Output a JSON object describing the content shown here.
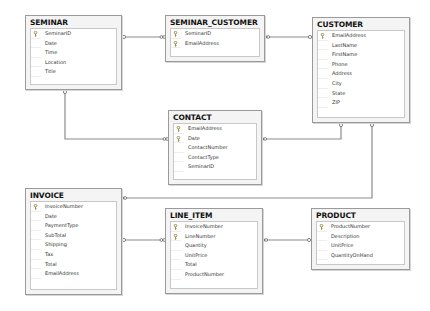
{
  "diagram": {
    "type": "database-schema",
    "tables": [
      {
        "id": "seminar",
        "name": "SEMINAR",
        "box": {
          "x": 25,
          "y": 15,
          "w": 97,
          "h": 75
        },
        "columns": [
          {
            "name": "SeminarID",
            "pk": true
          },
          {
            "name": "Date",
            "pk": false
          },
          {
            "name": "Time",
            "pk": false
          },
          {
            "name": "Location",
            "pk": false
          },
          {
            "name": "Title",
            "pk": false
          }
        ]
      },
      {
        "id": "seminar_customer",
        "name": "SEMINAR_CUSTOMER",
        "box": {
          "x": 165,
          "y": 15,
          "w": 100,
          "h": 47
        },
        "columns": [
          {
            "name": "SeminarID",
            "pk": true
          },
          {
            "name": "EmailAddress",
            "pk": true
          }
        ]
      },
      {
        "id": "customer",
        "name": "CUSTOMER",
        "box": {
          "x": 312,
          "y": 17,
          "w": 98,
          "h": 106
        },
        "columns": [
          {
            "name": "EmailAddress",
            "pk": true
          },
          {
            "name": "LastName",
            "pk": false
          },
          {
            "name": "FirstName",
            "pk": false
          },
          {
            "name": "Phone",
            "pk": false
          },
          {
            "name": "Address",
            "pk": false
          },
          {
            "name": "City",
            "pk": false
          },
          {
            "name": "State",
            "pk": false
          },
          {
            "name": "ZIP",
            "pk": false
          }
        ]
      },
      {
        "id": "contact",
        "name": "CONTACT",
        "box": {
          "x": 168,
          "y": 110,
          "w": 94,
          "h": 75
        },
        "columns": [
          {
            "name": "EmailAddress",
            "pk": true
          },
          {
            "name": "Date",
            "pk": true
          },
          {
            "name": "ContactNumber",
            "pk": false
          },
          {
            "name": "ContactType",
            "pk": false
          },
          {
            "name": "SeminarID",
            "pk": false
          }
        ]
      },
      {
        "id": "invoice",
        "name": "INVOICE",
        "box": {
          "x": 25,
          "y": 188,
          "w": 97,
          "h": 107
        },
        "columns": [
          {
            "name": "InvoiceNumber",
            "pk": true
          },
          {
            "name": "Date",
            "pk": false
          },
          {
            "name": "PaymentType",
            "pk": false
          },
          {
            "name": "SubTotal",
            "pk": false
          },
          {
            "name": "Shipping",
            "pk": false
          },
          {
            "name": "Tax",
            "pk": false
          },
          {
            "name": "Total",
            "pk": false
          },
          {
            "name": "EmailAddress",
            "pk": false
          }
        ]
      },
      {
        "id": "line_item",
        "name": "LINE_ITEM",
        "box": {
          "x": 165,
          "y": 208,
          "w": 98,
          "h": 86
        },
        "columns": [
          {
            "name": "InvoiceNumber",
            "pk": true
          },
          {
            "name": "LineNumber",
            "pk": true
          },
          {
            "name": "Quantity",
            "pk": false
          },
          {
            "name": "UnitPrice",
            "pk": false
          },
          {
            "name": "Total",
            "pk": false
          },
          {
            "name": "ProductNumber",
            "pk": false
          }
        ]
      },
      {
        "id": "product",
        "name": "PRODUCT",
        "box": {
          "x": 311,
          "y": 208,
          "w": 99,
          "h": 62
        },
        "columns": [
          {
            "name": "ProductNumber",
            "pk": true
          },
          {
            "name": "Description",
            "pk": false
          },
          {
            "name": "UnitPrice",
            "pk": false
          },
          {
            "name": "QuantityOnHand",
            "pk": false
          }
        ]
      }
    ],
    "relationships": [
      {
        "from": "seminar",
        "to": "seminar_customer",
        "path": "M122,37 L165,37",
        "one_end": [
          124,
          37
        ],
        "many_end": [
          163,
          37
        ]
      },
      {
        "from": "customer",
        "to": "seminar_customer",
        "path": "M265,37 L312,37",
        "one_end": [
          310,
          37
        ],
        "many_end": [
          267,
          37
        ]
      },
      {
        "from": "seminar",
        "to": "contact",
        "path": "M65,90 L65,139 L168,139",
        "one_end": [
          65,
          92
        ],
        "many_end": [
          166,
          139
        ]
      },
      {
        "from": "customer",
        "to": "contact",
        "path": "M262,139 L341,139 L341,123",
        "one_end": [
          341,
          125
        ],
        "many_end": [
          264,
          139
        ]
      },
      {
        "from": "customer",
        "to": "invoice",
        "path": "M122,198 L372,198 L372,123",
        "one_end": [
          372,
          125
        ],
        "many_end": [
          124,
          198
        ]
      },
      {
        "from": "invoice",
        "to": "line_item",
        "path": "M122,240 L165,240",
        "one_end": [
          124,
          240
        ],
        "many_end": [
          163,
          240
        ]
      },
      {
        "from": "product",
        "to": "line_item",
        "path": "M263,240 L311,240",
        "one_end": [
          309,
          240
        ],
        "many_end": [
          265,
          240
        ]
      }
    ]
  }
}
